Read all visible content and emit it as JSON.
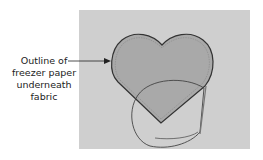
{
  "callout": {
    "line1": "Outline of",
    "line2": "freezer paper",
    "line3": "underneath",
    "line4": "fabric"
  },
  "colors": {
    "background_panel": "#cfcfcf",
    "heart_fill": "#a9a9a9",
    "outline": "#333333",
    "inner_dashed": "#8a8a8a"
  }
}
